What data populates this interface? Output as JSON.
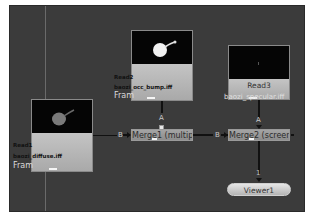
{
  "app": "Node Graph",
  "colors": {
    "canvas": "#3b3b3b",
    "node_body": "#b8b8b8",
    "merge_body": "#9a9a9a",
    "viewer_body": "#d8d8d8",
    "edge": "#111111"
  },
  "nodes": {
    "read1": {
      "name": "Read1",
      "file": "baozi_diffuse.iff",
      "frame_label": "Fram"
    },
    "read2": {
      "name": "Read2",
      "file": "baozi_occ_bump.iff",
      "frame_label": "Fram"
    },
    "read3": {
      "name": "Read3",
      "file": "baozi_specular.iff"
    },
    "merge1": {
      "name": "Merge1 (multiply)",
      "input_a": "A",
      "input_b": "B"
    },
    "merge2": {
      "name": "Merge2 (screen)",
      "input_a": "A",
      "input_b": "B"
    },
    "viewer1": {
      "name": "Viewer1",
      "input": "1"
    }
  },
  "icons": {
    "thumbnail_read1": "image-thumbnail-dim",
    "thumbnail_read2": "image-thumbnail-bright",
    "thumbnail_read3": "image-thumbnail-dark"
  }
}
